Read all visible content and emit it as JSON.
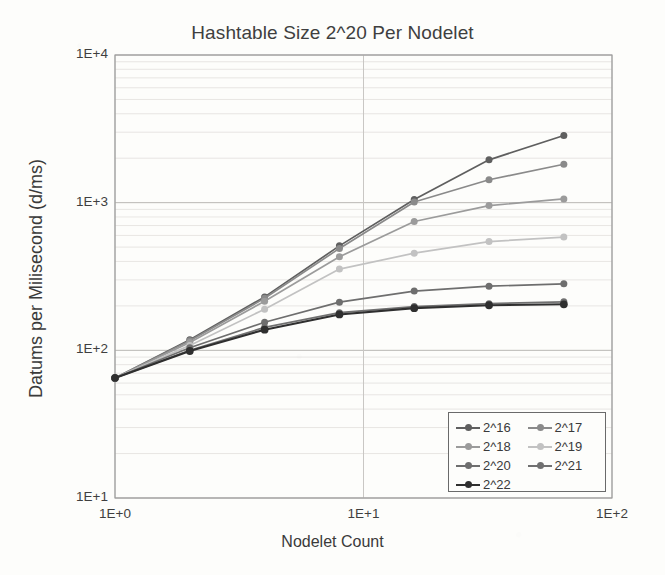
{
  "chart_data": {
    "type": "line",
    "title": "Hashtable Size 2^20 Per Nodelet",
    "xlabel": "Nodelet Count",
    "ylabel": "Datums per Milisecond (d/ms)",
    "xscale": "log",
    "yscale": "log",
    "xlim": [
      1,
      100
    ],
    "ylim": [
      10,
      10000
    ],
    "xticks": [
      "1E+0",
      "1E+1",
      "1E+2"
    ],
    "xtick_values": [
      1,
      10,
      100
    ],
    "yticks": [
      "1E+1",
      "1E+2",
      "1E+3",
      "1E+4"
    ],
    "ytick_values": [
      10,
      100,
      1000,
      10000
    ],
    "grid": true,
    "minor_grid": true,
    "legend_position": "bottom-right",
    "x": [
      1,
      2,
      4,
      8,
      16,
      32,
      64
    ],
    "series": [
      {
        "name": "2^16",
        "color": "#5f5f5f",
        "values": [
          65,
          118,
          230,
          510,
          1050,
          1950,
          2850
        ]
      },
      {
        "name": "2^17",
        "color": "#8a8a8a",
        "values": [
          65,
          116,
          225,
          490,
          1010,
          1430,
          1820
        ]
      },
      {
        "name": "2^18",
        "color": "#9b9b9b",
        "values": [
          65,
          113,
          215,
          430,
          745,
          955,
          1060
        ]
      },
      {
        "name": "2^19",
        "color": "#c2c2c2",
        "values": [
          65,
          108,
          190,
          355,
          455,
          545,
          585
        ]
      },
      {
        "name": "2^20",
        "color": "#6e6e6e",
        "values": [
          65,
          104,
          155,
          212,
          252,
          272,
          282
        ]
      },
      {
        "name": "2^21",
        "color": "#707070",
        "values": [
          65,
          100,
          143,
          180,
          198,
          207,
          213
        ]
      },
      {
        "name": "2^22",
        "color": "#2f2f2f",
        "values": [
          65,
          99,
          138,
          175,
          193,
          202,
          205
        ]
      }
    ]
  },
  "legend": {
    "items": [
      "2^16",
      "2^17",
      "2^18",
      "2^19",
      "2^20",
      "2^21",
      "2^22"
    ]
  }
}
